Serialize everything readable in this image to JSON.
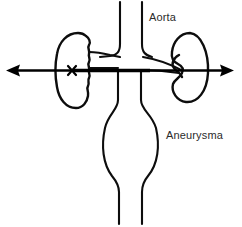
{
  "figure": {
    "background_color": "#ffffff",
    "line_color": "#0d0d0d",
    "text_color": "#2b2b2b",
    "width": 242,
    "height": 227
  },
  "labels": {
    "aorta": "Aorta",
    "aneurysma": "Aneurysma"
  },
  "structures": {
    "aorta_name": "aorta-vessel",
    "aneurysm_name": "aneurysm-bulge",
    "left_kidney_name": "left-kidney",
    "right_kidney_name": "right-kidney",
    "left_renal_artery_name": "left-renal-artery",
    "right_renal_artery_name": "right-renal-artery",
    "occlusion_marker": "x",
    "guide_axis_name": "horizontal-guide-arrow"
  }
}
